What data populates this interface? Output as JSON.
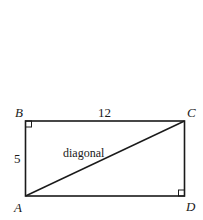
{
  "figure": {
    "shape": "rectangle",
    "vertices": {
      "A": {
        "label": "A"
      },
      "B": {
        "label": "B"
      },
      "C": {
        "label": "C"
      },
      "D": {
        "label": "D"
      }
    },
    "sides": {
      "top": {
        "from": "B",
        "to": "C",
        "length_label": "12"
      },
      "left": {
        "from": "A",
        "to": "B",
        "length_label": "5"
      }
    },
    "diagonal": {
      "from": "A",
      "to": "C",
      "label": "diagonal"
    },
    "right_angle_markers": [
      "B",
      "D"
    ],
    "colors": {
      "stroke": "#1a1a1a",
      "background": "#ffffff"
    }
  }
}
